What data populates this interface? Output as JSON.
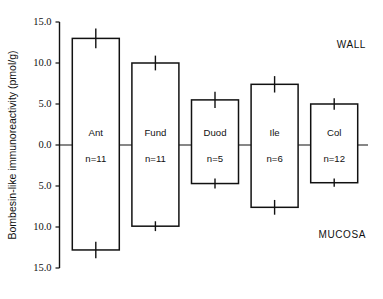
{
  "chart_data": {
    "type": "bar",
    "title": "",
    "xlabel": "",
    "ylabel": "Bombesin-like immunoreactivity (pmol/g)",
    "ylim": [
      -15.0,
      15.0
    ],
    "grid": false,
    "legend_position": "none",
    "y_tick_labels": [
      "15.0",
      "10.0",
      "5.0",
      "0.0",
      "5.0",
      "10.0",
      "15.0"
    ],
    "y_tick_values": [
      15,
      10,
      5,
      0,
      -5,
      -10,
      -15
    ],
    "categories": [
      "Ant",
      "Fund",
      "Duod",
      "Ile",
      "Col"
    ],
    "n_labels": [
      "n=11",
      "n=11",
      "n=5",
      "n=6",
      "n=12"
    ],
    "n_values": [
      11,
      11,
      5,
      6,
      12
    ],
    "series": [
      {
        "name": "WALL",
        "direction": "up",
        "values": [
          13.0,
          10.0,
          5.5,
          7.4,
          5.0
        ],
        "errors": [
          1.2,
          0.9,
          1.0,
          1.0,
          0.7
        ]
      },
      {
        "name": "MUCOSA",
        "direction": "down",
        "values": [
          12.8,
          9.9,
          4.7,
          7.6,
          4.6
        ],
        "errors": [
          1.0,
          0.6,
          0.6,
          0.9,
          0.5
        ]
      }
    ],
    "annotations": [
      {
        "text": "WALL",
        "position": "top-right"
      },
      {
        "text": "MUCOSA",
        "position": "bottom-right"
      }
    ]
  },
  "axis": {
    "y_title": "Bombesin-like immunoreactivity (pmol/g)"
  },
  "annotations": {
    "wall": "WALL",
    "mucosa": "MUCOSA"
  }
}
